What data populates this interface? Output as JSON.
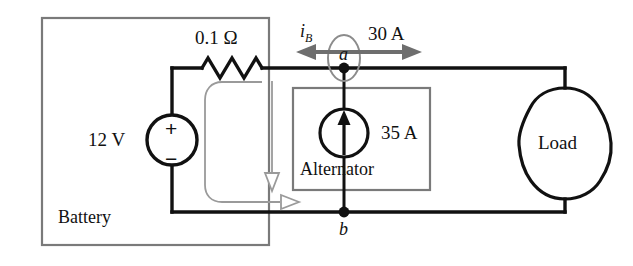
{
  "figure": {
    "type": "circuit-diagram"
  },
  "colors": {
    "wire": "#111111",
    "annotation": "#8c8c8c",
    "box_outline": "#7a7a7a",
    "background": "#ffffff",
    "text": "#111111"
  },
  "labels": {
    "resistor": "0.1 Ω",
    "source_voltage": "12 V",
    "plus_sign": "+",
    "minus_sign": "−",
    "battery_box": "Battery",
    "alternator_box": "Alternator",
    "alternator_current": "35 A",
    "node_a": "a",
    "node_b": "b",
    "branch_current": "i",
    "branch_current_sub": "B",
    "load_current": "30 A",
    "load_box": "Load"
  },
  "elements": {
    "battery": {
      "name": "Battery",
      "emf": "12 V",
      "internal_resistance": "0.1 Ω",
      "polarity_top": "+",
      "polarity_bottom": "−"
    },
    "alternator": {
      "name": "Alternator",
      "type": "current-source",
      "value": "35 A",
      "direction": "up"
    },
    "load": {
      "name": "Load",
      "current": "30 A",
      "direction": "right"
    },
    "nodes": [
      {
        "id": "a",
        "position": "top"
      },
      {
        "id": "b",
        "position": "bottom"
      }
    ],
    "currents": [
      {
        "label": "i_B",
        "value": "",
        "direction": "left",
        "location": "node a, toward battery"
      },
      {
        "label": "30 A",
        "value": "30 A",
        "direction": "right",
        "location": "node a, toward load"
      },
      {
        "label": "35 A",
        "value": "35 A",
        "direction": "up",
        "location": "alternator branch"
      }
    ]
  }
}
